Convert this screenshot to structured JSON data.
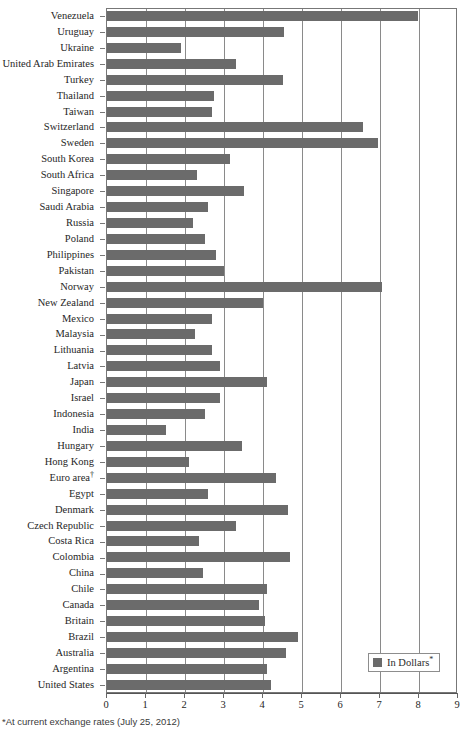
{
  "chart_data": {
    "type": "bar",
    "orientation": "horizontal",
    "title": "",
    "xlabel": "",
    "ylabel": "",
    "xlim": [
      0,
      9
    ],
    "xticks": [
      0,
      1,
      2,
      3,
      4,
      5,
      6,
      7,
      8,
      9
    ],
    "grid": true,
    "legend": {
      "position": "bottom-right",
      "entries": [
        {
          "label": "In Dollars",
          "marker": "*",
          "color": "#6b6b6b"
        }
      ]
    },
    "footnote": "*At current exchange rates (July 25, 2012)",
    "dagger_note": "†",
    "bar_color": "#6b6b6b",
    "categories": [
      "Venezuela",
      "Uruguay",
      "Ukraine",
      "United Arab Emirates",
      "Turkey",
      "Thailand",
      "Taiwan",
      "Switzerland",
      "Sweden",
      "South Korea",
      "South Africa",
      "Singapore",
      "Saudi Arabia",
      "Russia",
      "Poland",
      "Philippines",
      "Pakistan",
      "Norway",
      "New Zealand",
      "Mexico",
      "Malaysia",
      "Lithuania",
      "Latvia",
      "Japan",
      "Israel",
      "Indonesia",
      "India",
      "Hungary",
      "Hong Kong",
      "Euro area†",
      "Egypt",
      "Denmark",
      "Czech Republic",
      "Costa Rica",
      "Colombia",
      "China",
      "Chile",
      "Canada",
      "Britain",
      "Brazil",
      "Australia",
      "Argentina",
      "United States"
    ],
    "values": [
      7.97,
      4.55,
      1.9,
      3.3,
      4.5,
      2.75,
      2.7,
      6.56,
      6.94,
      3.15,
      2.3,
      3.5,
      2.6,
      2.2,
      2.5,
      2.8,
      3.0,
      7.06,
      4.0,
      2.7,
      2.25,
      2.7,
      2.9,
      4.1,
      2.9,
      2.5,
      1.5,
      3.45,
      2.1,
      4.34,
      2.6,
      4.65,
      3.3,
      2.35,
      4.7,
      2.45,
      4.1,
      3.9,
      4.05,
      4.9,
      4.6,
      4.1,
      4.2
    ]
  }
}
